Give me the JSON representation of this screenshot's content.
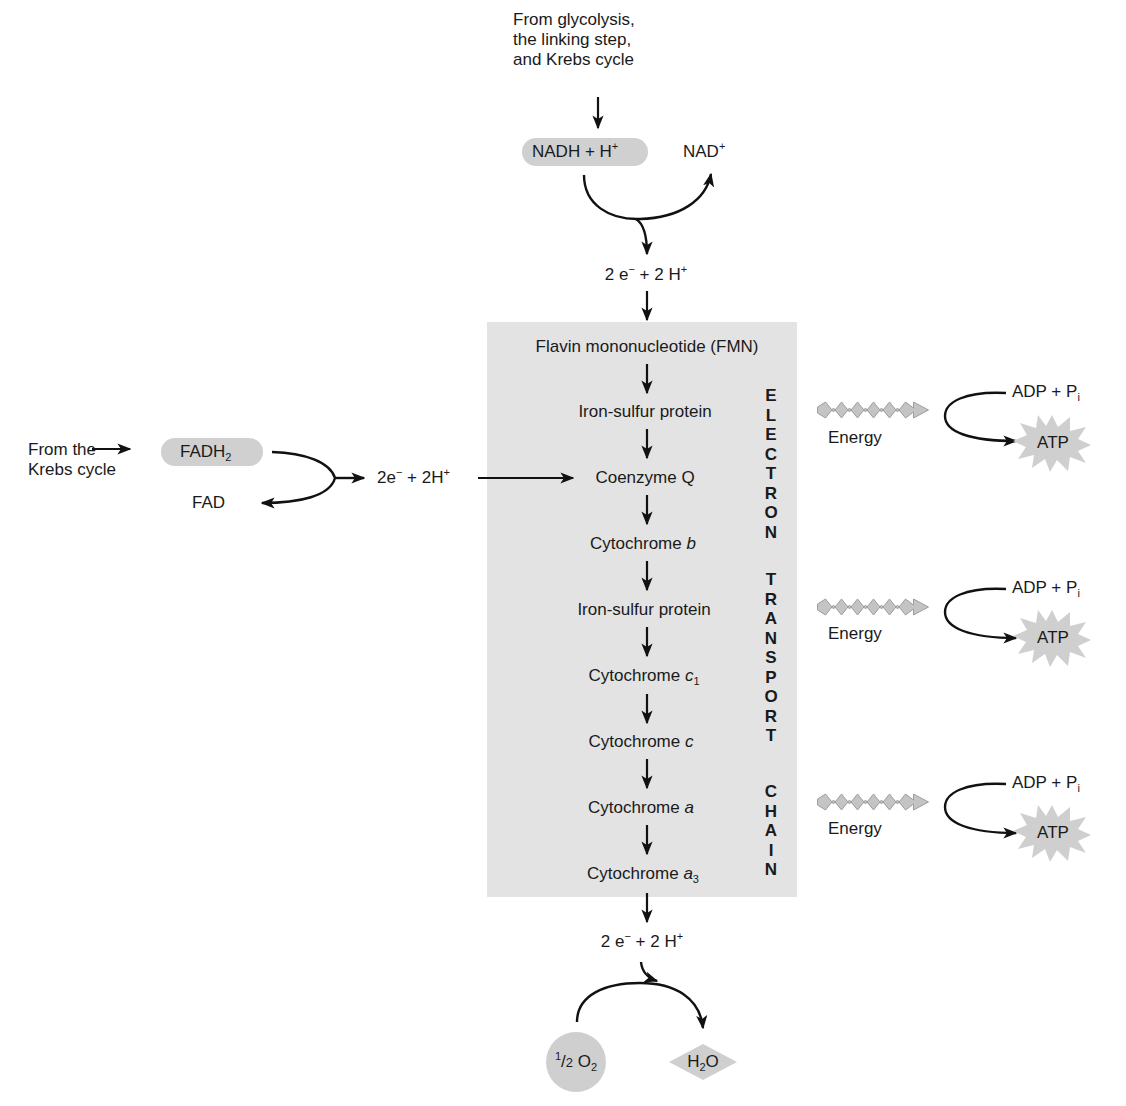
{
  "colors": {
    "chain_box": "#e3e3e3",
    "oval_fill": "#d0d0d0",
    "energy_arrow": "#c4c4c4",
    "atp_starburst": "#cfcfcf",
    "line": "#111111"
  },
  "top_input": {
    "source_lines": [
      "From glycolysis,",
      "the linking step,",
      "and Krebs cycle"
    ],
    "nadh": {
      "base": "NADH + H",
      "sup": "+"
    },
    "nad": {
      "base": "NAD",
      "sup": "+"
    },
    "output": {
      "e_prefix": "2 e",
      "e_sup": "−",
      "h_mid": " + 2 H",
      "h_sup": "+"
    }
  },
  "side_input": {
    "source_lines": [
      "From the",
      "Krebs cycle"
    ],
    "fadh2": {
      "base": "FADH",
      "sub": "2"
    },
    "fad": "FAD",
    "output": {
      "e_prefix": "2e",
      "e_sup": "−",
      "h_mid": " + 2H",
      "h_sup": "+"
    }
  },
  "chain": {
    "label_words": [
      "ELECTRON",
      "TRANSPORT",
      "CHAIN"
    ],
    "carriers": [
      {
        "name": "Flavin mononucleotide (FMN)",
        "italic": "",
        "sub": ""
      },
      {
        "name": "Iron-sulfur protein",
        "italic": "",
        "sub": ""
      },
      {
        "name": "Coenzyme Q",
        "italic": "",
        "sub": ""
      },
      {
        "name": "Cytochrome ",
        "italic": "b",
        "sub": ""
      },
      {
        "name": "Iron-sulfur protein",
        "italic": "",
        "sub": ""
      },
      {
        "name": "Cytochrome ",
        "italic": "c",
        "sub": "1"
      },
      {
        "name": "Cytochrome ",
        "italic": "c",
        "sub": ""
      },
      {
        "name": "Cytochrome ",
        "italic": "a",
        "sub": ""
      },
      {
        "name": "Cytochrome ",
        "italic": "a",
        "sub": "3"
      }
    ]
  },
  "energy_sites": [
    {
      "energy_label": "Energy",
      "adp": {
        "base": "ADP + P",
        "sub": "i"
      },
      "atp": "ATP"
    },
    {
      "energy_label": "Energy",
      "adp": {
        "base": "ADP + P",
        "sub": "i"
      },
      "atp": "ATP"
    },
    {
      "energy_label": "Energy",
      "adp": {
        "base": "ADP + P",
        "sub": "i"
      },
      "atp": "ATP"
    }
  ],
  "bottom_output": {
    "electrons": {
      "e_prefix": "2 e",
      "e_sup": "−",
      "h_mid": " + 2 H",
      "h_sup": "+"
    },
    "oxygen": {
      "frac_num": "1",
      "frac_den": "2",
      "base": " O",
      "sub": "2"
    },
    "water": {
      "pre": "H",
      "sub": "2",
      "post": "O"
    }
  }
}
